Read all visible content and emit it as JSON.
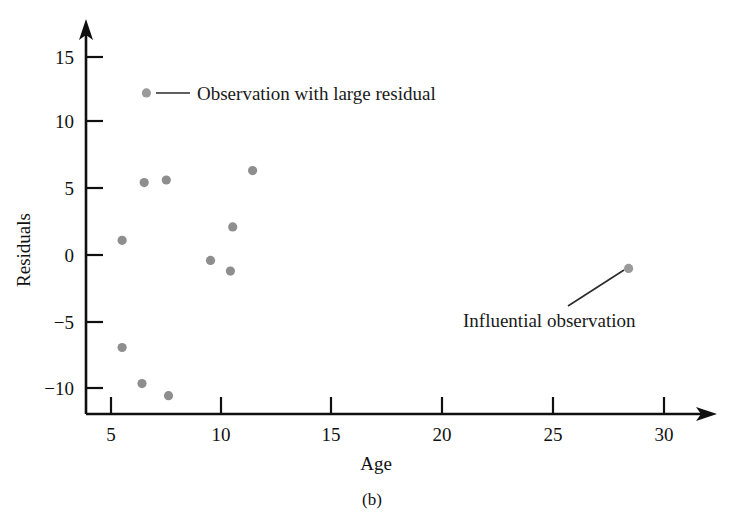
{
  "figure": {
    "caption": "(b)",
    "accent_color": "#8e8e8e",
    "axis_color": "#101010"
  },
  "axes": {
    "x_title": "Age",
    "y_title": "Residuals",
    "x_ticks": [
      "5",
      "10",
      "15",
      "20",
      "25",
      "30"
    ],
    "y_ticks": [
      "15",
      "10",
      "5",
      "0",
      "−5",
      "−10"
    ]
  },
  "annotations": [
    {
      "name": "large-residual",
      "text": "Observation with large residual"
    },
    {
      "name": "influential",
      "text": "Influential observation"
    }
  ],
  "chart_data": {
    "type": "scatter",
    "title": "",
    "xlabel": "Age",
    "ylabel": "Residuals",
    "xlim": [
      3.5,
      31.5
    ],
    "ylim": [
      -12.5,
      16.5
    ],
    "xticks": [
      5,
      10,
      15,
      20,
      25,
      30
    ],
    "yticks": [
      15,
      10,
      5,
      0,
      -5,
      -10
    ],
    "grid": false,
    "legend": false,
    "marker_color": "#8e8e8e",
    "points": [
      {
        "x": 6.6,
        "y": 12.1,
        "label": "Observation with large residual"
      },
      {
        "x": 6.5,
        "y": 5.4,
        "label": ""
      },
      {
        "x": 7.5,
        "y": 5.6,
        "label": ""
      },
      {
        "x": 11.4,
        "y": 6.3,
        "label": ""
      },
      {
        "x": 5.5,
        "y": 1.1,
        "label": ""
      },
      {
        "x": 10.5,
        "y": 2.1,
        "label": ""
      },
      {
        "x": 9.5,
        "y": -0.4,
        "label": ""
      },
      {
        "x": 10.4,
        "y": -1.2,
        "label": ""
      },
      {
        "x": 5.5,
        "y": -6.9,
        "label": ""
      },
      {
        "x": 6.4,
        "y": -9.6,
        "label": ""
      },
      {
        "x": 7.6,
        "y": -10.5,
        "label": ""
      },
      {
        "x": 28.4,
        "y": -1.0,
        "label": "Influential observation"
      }
    ]
  }
}
